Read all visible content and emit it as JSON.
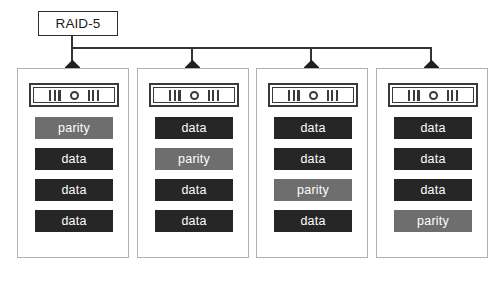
{
  "diagram": {
    "controller": {
      "label": "RAID-5"
    },
    "caption": {
      "text": "",
      "visible": false
    },
    "colors": {
      "data_block": "#262626",
      "parity_block": "#6e6e6e",
      "block_text": "#ffffff",
      "panel_border": "#b2b2b2",
      "connector": "#333333",
      "controller_border": "#2e2e2e",
      "background": "#ffffff"
    },
    "drive_icon": {
      "name": "disk-drive-icon",
      "glyph": "III O III"
    },
    "disks": [
      {
        "name": "disk-1",
        "blocks": [
          {
            "label": "parity",
            "kind": "parity"
          },
          {
            "label": "data",
            "kind": "data"
          },
          {
            "label": "data",
            "kind": "data"
          },
          {
            "label": "data",
            "kind": "data"
          }
        ]
      },
      {
        "name": "disk-2",
        "blocks": [
          {
            "label": "data",
            "kind": "data"
          },
          {
            "label": "parity",
            "kind": "parity"
          },
          {
            "label": "data",
            "kind": "data"
          },
          {
            "label": "data",
            "kind": "data"
          }
        ]
      },
      {
        "name": "disk-3",
        "blocks": [
          {
            "label": "data",
            "kind": "data"
          },
          {
            "label": "data",
            "kind": "data"
          },
          {
            "label": "parity",
            "kind": "parity"
          },
          {
            "label": "data",
            "kind": "data"
          }
        ]
      },
      {
        "name": "disk-4",
        "blocks": [
          {
            "label": "data",
            "kind": "data"
          },
          {
            "label": "data",
            "kind": "data"
          },
          {
            "label": "data",
            "kind": "data"
          },
          {
            "label": "parity",
            "kind": "parity"
          }
        ]
      }
    ],
    "layout": {
      "panel_left_positions": [
        17,
        137,
        256,
        376
      ],
      "connector_x_positions": [
        71,
        191,
        310,
        430
      ],
      "bus_y": 47
    }
  }
}
